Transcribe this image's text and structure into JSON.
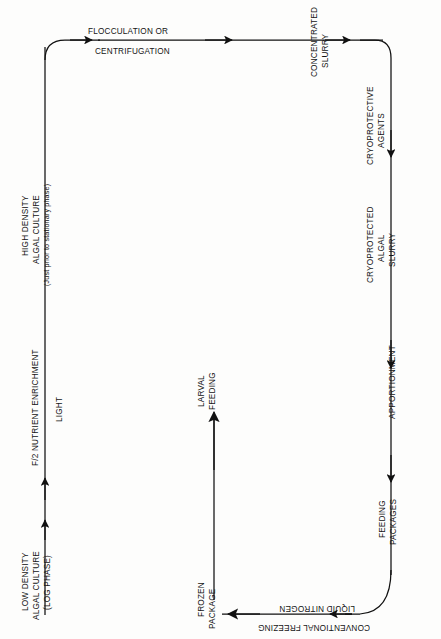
{
  "diagram": {
    "type": "cyclic-process-flowchart",
    "line_color": "#111111",
    "background_color": "#fdfdfc",
    "nodes": [
      {
        "id": "low-density-culture",
        "lines": [
          "LOW DENSITY",
          "ALGAL CULTURE",
          "(LOG PHASE)"
        ],
        "orientation": "vertical-up",
        "position": "left-column-bottom"
      },
      {
        "id": "f2-nutrient-enrichment",
        "lines": [
          "F/2 NUTRIENT ENRICHMENT"
        ],
        "orientation": "vertical-up",
        "position": "left-column-middle"
      },
      {
        "id": "light",
        "lines": [
          "LIGHT"
        ],
        "orientation": "vertical-up",
        "position": "left-column-middle-right"
      },
      {
        "id": "high-density-culture",
        "lines": [
          "HIGH DENSITY",
          "ALGAL CULTURE",
          "(Just prior to stationary phase)"
        ],
        "orientation": "vertical-up",
        "position": "left-column-top"
      },
      {
        "id": "flocculation",
        "lines": [
          "FLOCCULATION OR"
        ],
        "orientation": "horizontal",
        "position": "top-row-above-line"
      },
      {
        "id": "centrifugation",
        "lines": [
          "CENTRIFUGATION"
        ],
        "orientation": "horizontal",
        "position": "top-row-below-line"
      },
      {
        "id": "concentrated-slurry",
        "lines": [
          "CONCENTRATED",
          "SLURRY"
        ],
        "orientation": "vertical-up",
        "position": "top-row-right"
      },
      {
        "id": "cryoprotective-agents",
        "lines": [
          "CRYOPROTECTIVE",
          "AGENTS"
        ],
        "orientation": "vertical-up",
        "position": "right-column-top"
      },
      {
        "id": "cryoprotected-slurry",
        "lines": [
          "CRYOPROTECTED",
          "ALGAL",
          "SLURRY"
        ],
        "orientation": "vertical-up",
        "position": "right-column-upper"
      },
      {
        "id": "apportionment",
        "lines": [
          "APPORTIONMENT"
        ],
        "orientation": "vertical-up",
        "position": "right-column-middle"
      },
      {
        "id": "feeding-packages",
        "lines": [
          "FEEDING",
          "PACKAGES"
        ],
        "orientation": "vertical-up",
        "position": "right-column-lower"
      },
      {
        "id": "liquid-nitrogen",
        "lines": [
          "LIQUID NITROGEN"
        ],
        "orientation": "rotated-180",
        "position": "bottom-row-above-line"
      },
      {
        "id": "conventional-freezing",
        "lines": [
          "CONVENTIONAL FREEZING"
        ],
        "orientation": "rotated-180",
        "position": "bottom-row-below-line"
      },
      {
        "id": "frozen-package",
        "lines": [
          "FROZEN",
          "PACKAGE"
        ],
        "orientation": "vertical-up",
        "position": "bottom-center"
      },
      {
        "id": "larval-feeding",
        "lines": [
          "LARVAL",
          "FEEDING"
        ],
        "orientation": "vertical-up",
        "position": "center-column-top"
      }
    ],
    "labels": {
      "flocculation_or": "FLOCCULATION OR",
      "centrifugation": "CENTRIFUGATION",
      "concentrated": "CONCENTRATED",
      "slurry": "SLURRY",
      "cryoprotective": "CRYOPROTECTIVE",
      "agents": "AGENTS",
      "cryoprotected": "CRYOPROTECTED",
      "algal": "ALGAL",
      "slurry2": "SLURRY",
      "apportionment": "APPORTIONMENT",
      "feeding": "FEEDING",
      "packages": "PACKAGES",
      "liquid_nitrogen": "LIQUID NITROGEN",
      "conventional_freezing": "CONVENTIONAL FREEZING",
      "frozen": "FROZEN",
      "package": "PACKAGE",
      "larval": "LARVAL",
      "feeding2": "FEEDING",
      "high_density": "HIGH DENSITY",
      "algal_culture": "ALGAL CULTURE",
      "just_prior": "(Just prior to stationary phase)",
      "f2_nutrient": "F/2 NUTRIENT ENRICHMENT",
      "light": "LIGHT",
      "low_density": "LOW DENSITY",
      "algal_culture2": "ALGAL CULTURE",
      "log_phase": "(LOG PHASE)"
    }
  }
}
